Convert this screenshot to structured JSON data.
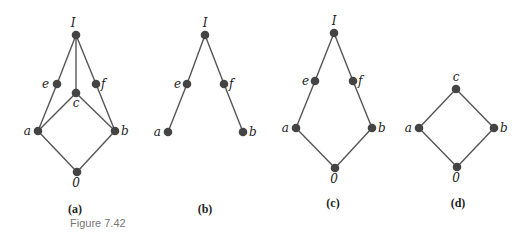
{
  "figure": {
    "label": "Figure 7.42",
    "label_pos": {
      "x": 70,
      "y": 227
    },
    "node_color": "#444444",
    "edge_color": "#555555",
    "label_color": "#222222"
  },
  "diagrams": [
    {
      "id": "a",
      "caption": "(a)",
      "caption_pos": {
        "x": 75,
        "y": 213
      },
      "nodes": [
        {
          "id": "I",
          "label": "I",
          "x": 76,
          "y": 35,
          "lx": 73,
          "ly": 27,
          "anchor": "middle"
        },
        {
          "id": "e",
          "label": "e",
          "x": 57,
          "y": 84,
          "lx": 49,
          "ly": 88,
          "anchor": "end"
        },
        {
          "id": "c",
          "label": "c",
          "x": 76,
          "y": 93,
          "lx": 76,
          "ly": 107,
          "anchor": "middle"
        },
        {
          "id": "f",
          "label": "f",
          "x": 96,
          "y": 84,
          "lx": 101,
          "ly": 88,
          "anchor": "start"
        },
        {
          "id": "a",
          "label": "a",
          "x": 38,
          "y": 131,
          "lx": 31,
          "ly": 135,
          "anchor": "end"
        },
        {
          "id": "b",
          "label": "b",
          "x": 115,
          "y": 131,
          "lx": 121,
          "ly": 135,
          "anchor": "start"
        },
        {
          "id": "0",
          "label": "0",
          "x": 77,
          "y": 172,
          "lx": 76,
          "ly": 187,
          "anchor": "middle"
        }
      ],
      "edges": [
        [
          "I",
          "e"
        ],
        [
          "I",
          "c"
        ],
        [
          "I",
          "f"
        ],
        [
          "e",
          "a"
        ],
        [
          "c",
          "a"
        ],
        [
          "c",
          "b"
        ],
        [
          "f",
          "b"
        ],
        [
          "a",
          "0"
        ],
        [
          "b",
          "0"
        ]
      ]
    },
    {
      "id": "b",
      "caption": "(b)",
      "caption_pos": {
        "x": 205,
        "y": 213
      },
      "nodes": [
        {
          "id": "I",
          "label": "I",
          "x": 205,
          "y": 35,
          "lx": 205,
          "ly": 27,
          "anchor": "middle"
        },
        {
          "id": "e",
          "label": "e",
          "x": 187,
          "y": 84,
          "lx": 181,
          "ly": 88,
          "anchor": "end"
        },
        {
          "id": "f",
          "label": "f",
          "x": 224,
          "y": 84,
          "lx": 229,
          "ly": 88,
          "anchor": "start"
        },
        {
          "id": "a",
          "label": "a",
          "x": 168,
          "y": 132,
          "lx": 161,
          "ly": 136,
          "anchor": "end"
        },
        {
          "id": "b",
          "label": "b",
          "x": 243,
          "y": 132,
          "lx": 249,
          "ly": 136,
          "anchor": "start"
        }
      ],
      "edges": [
        [
          "I",
          "e"
        ],
        [
          "I",
          "f"
        ],
        [
          "e",
          "a"
        ],
        [
          "f",
          "b"
        ]
      ]
    },
    {
      "id": "c",
      "caption": "(c)",
      "caption_pos": {
        "x": 333,
        "y": 207
      },
      "nodes": [
        {
          "id": "I",
          "label": "I",
          "x": 334,
          "y": 33,
          "lx": 334,
          "ly": 25,
          "anchor": "middle"
        },
        {
          "id": "e",
          "label": "e",
          "x": 315,
          "y": 81,
          "lx": 309,
          "ly": 85,
          "anchor": "end"
        },
        {
          "id": "f",
          "label": "f",
          "x": 353,
          "y": 81,
          "lx": 358,
          "ly": 85,
          "anchor": "start"
        },
        {
          "id": "a",
          "label": "a",
          "x": 296,
          "y": 128,
          "lx": 289,
          "ly": 132,
          "anchor": "end"
        },
        {
          "id": "b",
          "label": "b",
          "x": 372,
          "y": 128,
          "lx": 378,
          "ly": 132,
          "anchor": "start"
        },
        {
          "id": "0",
          "label": "0",
          "x": 335,
          "y": 168,
          "lx": 334,
          "ly": 183,
          "anchor": "middle"
        }
      ],
      "edges": [
        [
          "I",
          "e"
        ],
        [
          "I",
          "f"
        ],
        [
          "e",
          "a"
        ],
        [
          "f",
          "b"
        ],
        [
          "a",
          "0"
        ],
        [
          "b",
          "0"
        ]
      ]
    },
    {
      "id": "d",
      "caption": "(d)",
      "caption_pos": {
        "x": 458,
        "y": 207
      },
      "nodes": [
        {
          "id": "c",
          "label": "c",
          "x": 456,
          "y": 89,
          "lx": 456,
          "ly": 81,
          "anchor": "middle"
        },
        {
          "id": "a",
          "label": "a",
          "x": 419,
          "y": 128,
          "lx": 412,
          "ly": 132,
          "anchor": "end"
        },
        {
          "id": "b",
          "label": "b",
          "x": 494,
          "y": 128,
          "lx": 500,
          "ly": 132,
          "anchor": "start"
        },
        {
          "id": "0",
          "label": "0",
          "x": 457,
          "y": 167,
          "lx": 456,
          "ly": 182,
          "anchor": "middle"
        }
      ],
      "edges": [
        [
          "c",
          "a"
        ],
        [
          "c",
          "b"
        ],
        [
          "a",
          "0"
        ],
        [
          "b",
          "0"
        ]
      ]
    }
  ]
}
